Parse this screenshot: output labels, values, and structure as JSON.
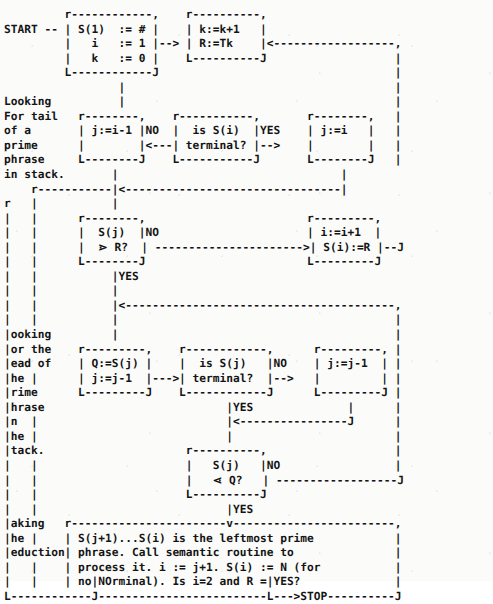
{
  "diagram": {
    "style": "ascii-art-monospace",
    "ink_color": "#141414",
    "paper_color": "#fbfbfa",
    "entry_label": "START",
    "exit_label": "STOP",
    "phase_labels": [
      "Looking\nFor tail\nof a\nprime\nphrase\nin stack.",
      "Looking\nfor the\nhead of\nthe\nprime\nphrase\nin\nthe\nstack.",
      "Making\nthe\nreduction"
    ],
    "boxes": [
      {
        "id": "init",
        "lines": [
          "S(1)  := #",
          "  i   := 1",
          "  k   := 0"
        ]
      },
      {
        "id": "next-token",
        "lines": [
          "k:=k+1",
          "R:=Tk"
        ]
      },
      {
        "id": "j-dec-tail",
        "lines": [
          "j:=i-1"
        ]
      },
      {
        "id": "is-si-term",
        "lines": [
          "is S(i)",
          "terminal?"
        ]
      },
      {
        "id": "j-assign-i",
        "lines": [
          "j:=i"
        ]
      },
      {
        "id": "sj-gt-r",
        "lines": [
          "S(j)",
          "⋗ R?"
        ]
      },
      {
        "id": "push",
        "lines": [
          "i:=i+1",
          "S(i):=R"
        ]
      },
      {
        "id": "q-assign",
        "lines": [
          "Q:=S(j)",
          "j:=j-1"
        ]
      },
      {
        "id": "is-sj-term",
        "lines": [
          "is S(j)",
          "terminal?"
        ]
      },
      {
        "id": "j-dec-head",
        "lines": [
          "j:=j-1"
        ]
      },
      {
        "id": "sj-lt-q",
        "lines": [
          "S(j)",
          "⋖ Q?"
        ]
      },
      {
        "id": "reduce",
        "lines": [
          "S(j+1)...S(i) is the leftmost prime",
          "phrase. Call semantic routine to",
          "process it. i := j+1. S(i) := N (for",
          "nonterminal). Is i=2 and R = '#'?"
        ]
      }
    ],
    "edge_labels": [
      "NO",
      "YES",
      "NO",
      "YES",
      "NO",
      "YES",
      "NO",
      "YES",
      "NO",
      "YES"
    ],
    "art": "START --┌──────────┐      ┌────────┐\n        │ S(1)  := # │      │ k:=k+1 │"
  },
  "ascii": {
    "rows": [
      "                   r----------,     r---------,",
      "START --| S(1)  := # |     | k:=k+1  |                       ,",
      "        |   i   := 1 |-->| R:=Tk   |<----------------------+",
      "        |   k   := 0 |     L---------J                       |",
      "        L----------J          |                              |",
      "                                |                            |",
      "Looking                         v                            |",
      "For tail  r--------,        r-----------,      r--------,    |",
      "of a      |j:=i-1  |   NO|  is S(i)   |YES|  j:=i   |    |",
      "prime     |        |<---|  terminal? |-->|         |    |",
      "phrase    L--------J        L-----------J      L--------J    |",
      "in stack.     |                                    |         |",
      "   r----------+------------>|<---------------------+         |",
      "   |          |                                              |",
      "   |          v                                              |",
      "   |      r--------,  NO                        r---------,  |",
      "   |      | S(j)   |-------------------------->| i:=i+1  |  |",
      "   |      | > R?   |                            |S(i):=R  |--+",
      "   |      L--------J                            L---------J",
      "   |          |YES",
      "   |          |<--------------------------------------------,",
      "   |          |                                             |",
      "Looking       v                                             |",
      "for the   r--------,      r------------,     r---------,    |",
      "head of   |Q:=S(j) |      |  is S(j)   | NO  | j:=j-1  |    |",
      "the       |j:=j-1  |--->  |  terminal? |-->  |         |    |",
      "prime     L--------J      L------------J     L---------J    |",
      "phrase                         |YES               |         |",
      "in                             |<-----------------+         |",
      "the                            |                            |",
      "stack.                         v                            |",
      "                         r----------,                       |",
      "                         |  S(j)    | NO                    |",
      "                         |  < Q?    |-----------------------+",
      "                         L----------J",
      "                              |YES",
      "Making  r---------------------v--------------------------,",
      "the     | S(j+1)...S(i) is the leftmost prime             |",
      "reduction| phrase. Call semantic routine to               |",
      "        | process it. i := j+1. S(i) := N (for            |",
      "        | nonterminal). Is i=2 and R = '#'?               |",
      "        L------------------------------------------------J",
      "            |NO                            |YES",
      "L-----------J                              L--->STOP"
    ],
    "art_text": "                    ,----------,       ,---------,\nSTART --| S(1)  := # |       | k:=k+1  |\n        |   i   := 1 |-->|  R:=Tk  |<--------------------,\n        |   k   := 0 |       `---------'                    |\n        `----------'"
  },
  "text_tokens": {
    "start": "START",
    "stop": "STOP",
    "yes": "YES",
    "no": "NO",
    "label_tail": [
      "Looking",
      "For tail",
      "of a",
      "prime",
      "phrase",
      "in stack."
    ],
    "label_head": [
      "Looking",
      "for the",
      "head of",
      "the",
      "prime",
      "phrase",
      "in",
      "the",
      "stack."
    ],
    "label_reduce": [
      "Making",
      "the",
      "reduction"
    ],
    "box_init": [
      "S(1)  := #",
      "  i   := 1",
      "  k   := 0"
    ],
    "box_next": [
      "k:=k+1",
      "R:=Tk"
    ],
    "box_jtail": [
      "j:=i-1"
    ],
    "box_isiterm": [
      "is S(i)",
      "terminal?"
    ],
    "box_jassign": [
      "j:=i"
    ],
    "box_sjgtr": [
      "S(j)",
      "⋗ R?"
    ],
    "box_push": [
      "i:=i+1",
      "S(i):=R"
    ],
    "box_qassign": [
      "Q:=S(j)",
      "j:=j-1"
    ],
    "box_isjterm": [
      "is S(j)",
      "terminal?"
    ],
    "box_jdec": [
      "j:=j-1"
    ],
    "box_sjltq": [
      "S(j)",
      "⋖ Q?"
    ],
    "box_reduce": [
      "S(j+1)...S(i) is the leftmost prime",
      "phrase. Call semantic routine to",
      "process it. i := j+1. S(i) := N (for",
      "nonterminal). Is i=2 and R = '#'?"
    ]
  },
  "canvas": {
    "full_art": "START --r----------,    r---------,\n        | S(1) := # |    | k:=k+1  |\n        |   i  := 1 |-->| R:=Tk   |<--------------------,\n        |   k  := 0 |    L---------J                     |\n        L----------J         |                           |"
  }
}
